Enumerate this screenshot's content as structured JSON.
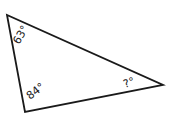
{
  "diagram": {
    "type": "triangle",
    "stroke_color": "#1a1a1a",
    "vertices": {
      "top_left": [
        7,
        15
      ],
      "bottom_left": [
        25,
        112
      ],
      "right": [
        163,
        85
      ]
    },
    "angles": {
      "top_left": "63°",
      "bottom_left": "84°",
      "right": "?°"
    }
  }
}
